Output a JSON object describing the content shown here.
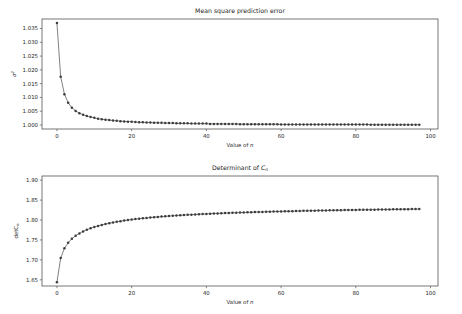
{
  "figure": {
    "width": 462,
    "height": 314,
    "background": "#ffffff",
    "line_color": "#4a4a4a",
    "marker_color": "#3d3d3d",
    "text_color": "#262626"
  },
  "chart_data": [
    {
      "type": "line",
      "id": "mean-square-prediction-error",
      "title": "Mean square prediction error",
      "title_parts": {
        "text": "Mean square prediction error"
      },
      "xlabel": "Value of n",
      "xlabel_parts": {
        "prefix": "Value of ",
        "italic": "n"
      },
      "ylabel": "σ²",
      "ylabel_parts": {
        "base": "σ",
        "sup": "2"
      },
      "xlim": [
        -4.0,
        102.0
      ],
      "ylim": [
        0.99855,
        1.03845
      ],
      "xticks": [
        0,
        20,
        40,
        60,
        80,
        100
      ],
      "xticklabels": [
        "0",
        "20",
        "40",
        "60",
        "80",
        "100"
      ],
      "yticks": [
        1.0,
        1.005,
        1.01,
        1.015,
        1.02,
        1.025,
        1.03,
        1.035
      ],
      "yticklabels": [
        "1.000",
        "1.005",
        "1.010",
        "1.015",
        "1.020",
        "1.025",
        "1.030",
        "1.035"
      ],
      "grid": false,
      "legend": null,
      "marker": "circle",
      "x": [
        0,
        1,
        2,
        3,
        4,
        5,
        6,
        7,
        8,
        9,
        10,
        11,
        12,
        13,
        14,
        15,
        16,
        17,
        18,
        19,
        20,
        21,
        22,
        23,
        24,
        25,
        26,
        27,
        28,
        29,
        30,
        31,
        32,
        33,
        34,
        35,
        36,
        37,
        38,
        39,
        40,
        41,
        42,
        43,
        44,
        45,
        46,
        47,
        48,
        49,
        50,
        51,
        52,
        53,
        54,
        55,
        56,
        57,
        58,
        59,
        60,
        61,
        62,
        63,
        64,
        65,
        66,
        67,
        68,
        69,
        70,
        71,
        72,
        73,
        74,
        75,
        76,
        77,
        78,
        79,
        80,
        81,
        82,
        83,
        84,
        85,
        86,
        87,
        88,
        89,
        90,
        91,
        92,
        93,
        94,
        95,
        96,
        97
      ],
      "values": [
        1.037,
        1.0175,
        1.0112,
        1.0081,
        1.0063,
        1.0051,
        1.0043,
        1.0037,
        1.0033,
        1.0029,
        1.0026,
        1.0023,
        1.0021,
        1.0019,
        1.0018,
        1.0016,
        1.0015,
        1.0014,
        1.0013,
        1.0012,
        1.0012,
        1.0011,
        1.001,
        1.001,
        1.0009,
        1.0009,
        1.0008,
        1.0008,
        1.0008,
        1.0007,
        1.0007,
        1.0007,
        1.0006,
        1.0006,
        1.0006,
        1.0006,
        1.0005,
        1.0005,
        1.0005,
        1.0005,
        1.0005,
        1.0004,
        1.0004,
        1.0004,
        1.0004,
        1.0004,
        1.0004,
        1.0004,
        1.0004,
        1.0003,
        1.0003,
        1.0003,
        1.0003,
        1.0003,
        1.0003,
        1.0003,
        1.0003,
        1.0003,
        1.0003,
        1.0003,
        1.0002,
        1.0002,
        1.0002,
        1.0002,
        1.0002,
        1.0002,
        1.0002,
        1.0002,
        1.0002,
        1.0002,
        1.0002,
        1.0002,
        1.0002,
        1.0002,
        1.0002,
        1.0002,
        1.0002,
        1.0002,
        1.0002,
        1.0002,
        1.0002,
        1.0002,
        1.0002,
        1.0002,
        1.0001,
        1.0001,
        1.0001,
        1.0001,
        1.0001,
        1.0001,
        1.0001,
        1.0001,
        1.0001,
        1.0001,
        1.0001,
        1.0001,
        1.0001,
        1.0001
      ]
    },
    {
      "type": "line",
      "id": "determinant-of-cn",
      "title": "Determinant of Cₙ",
      "title_parts": {
        "prefix": "Determinant of ",
        "italic": "C",
        "sub": "n"
      },
      "xlabel": "Value of n",
      "xlabel_parts": {
        "prefix": "Value of ",
        "italic": "n"
      },
      "ylabel": "detCₙ",
      "ylabel_parts": {
        "base": "detC",
        "sub": "n"
      },
      "xlim": [
        -4.0,
        102.0
      ],
      "ylim": [
        1.6345,
        1.9105
      ],
      "xticks": [
        0,
        20,
        40,
        60,
        80,
        100
      ],
      "xticklabels": [
        "0",
        "20",
        "40",
        "60",
        "80",
        "100"
      ],
      "yticks": [
        1.65,
        1.7,
        1.75,
        1.8,
        1.85,
        1.9
      ],
      "yticklabels": [
        "1.65",
        "1.70",
        "1.75",
        "1.80",
        "1.85",
        "1.90"
      ],
      "grid": false,
      "legend": null,
      "marker": "circle",
      "x": [
        0,
        1,
        2,
        3,
        4,
        5,
        6,
        7,
        8,
        9,
        10,
        11,
        12,
        13,
        14,
        15,
        16,
        17,
        18,
        19,
        20,
        21,
        22,
        23,
        24,
        25,
        26,
        27,
        28,
        29,
        30,
        31,
        32,
        33,
        34,
        35,
        36,
        37,
        38,
        39,
        40,
        41,
        42,
        43,
        44,
        45,
        46,
        47,
        48,
        49,
        50,
        51,
        52,
        53,
        54,
        55,
        56,
        57,
        58,
        59,
        60,
        61,
        62,
        63,
        64,
        65,
        66,
        67,
        68,
        69,
        70,
        71,
        72,
        73,
        74,
        75,
        76,
        77,
        78,
        79,
        80,
        81,
        82,
        83,
        84,
        85,
        86,
        87,
        88,
        89,
        90,
        91,
        92,
        93,
        94,
        95,
        96,
        97
      ],
      "values": [
        1.644,
        1.7045,
        1.729,
        1.743,
        1.753,
        1.7605,
        1.7665,
        1.7715,
        1.7757,
        1.7793,
        1.7825,
        1.7853,
        1.7878,
        1.79,
        1.792,
        1.7939,
        1.7956,
        1.7971,
        1.7986,
        1.7999,
        1.8011,
        1.8023,
        1.8034,
        1.8044,
        1.8053,
        1.8062,
        1.8071,
        1.8079,
        1.8086,
        1.8093,
        1.81,
        1.8107,
        1.8113,
        1.8119,
        1.8125,
        1.813,
        1.8135,
        1.814,
        1.8145,
        1.815,
        1.8154,
        1.8158,
        1.8162,
        1.8166,
        1.817,
        1.8174,
        1.8177,
        1.8181,
        1.8184,
        1.8187,
        1.819,
        1.8193,
        1.8196,
        1.8199,
        1.8202,
        1.8204,
        1.8207,
        1.8209,
        1.8212,
        1.8214,
        1.8217,
        1.8219,
        1.8221,
        1.8223,
        1.8226,
        1.8228,
        1.823,
        1.8232,
        1.8234,
        1.8236,
        1.8237,
        1.8239,
        1.8241,
        1.8243,
        1.8245,
        1.8246,
        1.8248,
        1.825,
        1.8251,
        1.8253,
        1.8254,
        1.8256,
        1.8257,
        1.8259,
        1.826,
        1.8261,
        1.8263,
        1.8264,
        1.8265,
        1.8267,
        1.8268,
        1.8269,
        1.827,
        1.8272,
        1.8273,
        1.8274,
        1.8275,
        1.8276
      ]
    }
  ]
}
